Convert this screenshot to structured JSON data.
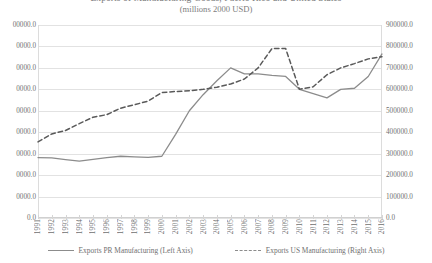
{
  "chart_data": {
    "type": "line",
    "title": "Exports of Manufacturing Goods, Puerto Rico and United States",
    "subtitle": "(millions 2000 USD)",
    "xlabel": "",
    "ylabel": "",
    "grid": true,
    "legend_position": "bottom",
    "x": [
      1991,
      1992,
      1993,
      1994,
      1995,
      1996,
      1997,
      1998,
      1999,
      2000,
      2001,
      2002,
      2003,
      2004,
      2005,
      2006,
      2007,
      2008,
      2009,
      2010,
      2011,
      2012,
      2013,
      2014,
      2015,
      2016
    ],
    "categories": [
      "1991",
      "1992",
      "1993",
      "1994",
      "1995",
      "1996",
      "1997",
      "1998",
      "1999",
      "2000",
      "2001",
      "2002",
      "2003",
      "2004",
      "2005",
      "2006",
      "2007",
      "2008",
      "2009",
      "2010",
      "2011",
      "2012",
      "2013",
      "2014",
      "2015",
      "2016"
    ],
    "left_axis": {
      "label": "",
      "ticks": [
        "0.0",
        "0000.0",
        "0000.0",
        "0000.0",
        "0000.0",
        "0000.0",
        "0000.0",
        "0000.0",
        "0000.0",
        "00000.0"
      ],
      "ylim": [
        0,
        45000
      ],
      "tick_values": [
        0,
        5000,
        10000,
        15000,
        20000,
        25000,
        30000,
        35000,
        40000,
        45000
      ]
    },
    "right_axis": {
      "label": "",
      "ticks": [
        "0.0",
        "100000.0",
        "200000.0",
        "300000.0",
        "400000.0",
        "500000.0",
        "600000.0",
        "700000.0",
        "800000.0",
        "900000.0"
      ],
      "ylim": [
        0,
        900000
      ],
      "tick_values": [
        0,
        100000,
        200000,
        300000,
        400000,
        500000,
        600000,
        700000,
        800000,
        900000
      ]
    },
    "series": [
      {
        "name": "Exports PR Manufacturing (Left Axis)",
        "axis": "left",
        "style": "solid",
        "color": "#8c8c8c",
        "values_right_scale": [
          282000,
          280000,
          272000,
          265000,
          273000,
          282000,
          288000,
          285000,
          283000,
          288000,
          390000,
          500000,
          575000,
          640000,
          700000,
          672000,
          672000,
          665000,
          660000,
          600000,
          580000,
          560000,
          600000,
          605000,
          660000,
          765000
        ],
        "values": [
          14100,
          14000,
          13600,
          13250,
          13650,
          14100,
          14400,
          14250,
          14150,
          14400,
          19500,
          25000,
          28750,
          32000,
          35000,
          33600,
          33600,
          33250,
          33000,
          30000,
          29000,
          28000,
          30000,
          30250,
          33000,
          38250
        ]
      },
      {
        "name": "Exports US Manufacturing (Right Axis)",
        "axis": "right",
        "style": "dashed",
        "color": "#595959",
        "values": [
          355000,
          392000,
          408000,
          440000,
          470000,
          482000,
          512000,
          528000,
          545000,
          585000,
          590000,
          593000,
          600000,
          610000,
          625000,
          648000,
          700000,
          790000,
          790000,
          600000,
          612000,
          668000,
          700000,
          720000,
          742000,
          752000
        ]
      }
    ],
    "legend": [
      {
        "label": "Exports PR Manufacturing (Left Axis)",
        "style": "solid"
      },
      {
        "label": "Exports US Manufacturing (Right Axis)",
        "style": "dashed"
      }
    ]
  }
}
